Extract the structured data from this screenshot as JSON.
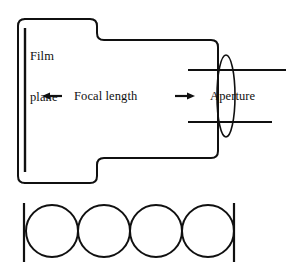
{
  "figure": {
    "background_color": "#ffffff",
    "stroke_color": "#101010",
    "text_color": "#101010",
    "width": 290,
    "height": 271
  },
  "labels": {
    "film_plane": "Film\nplane",
    "film_plane_line1": "Film",
    "film_plane_line2": "plane",
    "focal_length": "Focal length",
    "aperture": "Aperture"
  },
  "icons": {
    "left_arrow": "left-arrow-icon",
    "right_arrow": "right-arrow-icon",
    "lens_ellipse": "lens-ellipse-icon",
    "film-plane-line": "film-plane-line-icon"
  },
  "geometry": {
    "camera_body": {
      "outline_path": "M 25 19 L 97 19 L 97 40 L 218 40 L 218 158 L 97 158 L 97 183 L 25 183",
      "corner_radius": 7,
      "stroke_width": 2
    },
    "film_plane_line": {
      "x": 25,
      "y1": 28,
      "y2": 172,
      "stroke_width": 2.4
    },
    "lens": {
      "cx": 226,
      "cy": 96,
      "rx": 9,
      "ry": 41,
      "stroke_width": 1.6
    },
    "aperture_blade_upper": {
      "x1": 188,
      "x2": 286,
      "y": 70,
      "stroke_width": 2.2
    },
    "aperture_blade_lower": {
      "x1": 188,
      "x2": 272,
      "y": 122,
      "stroke_width": 2.2
    },
    "focal_arrow_left": {
      "x1": 62,
      "x2": 44,
      "y": 96
    },
    "focal_arrow_right": {
      "x1": 174,
      "x2": 194,
      "y": 96
    },
    "circle_row": {
      "count": 4,
      "radius": 26,
      "cy": 231,
      "centers_x": [
        52,
        104,
        156,
        208
      ],
      "left_bar_x": 24,
      "right_bar_x": 234,
      "bar_y1": 203,
      "bar_y2": 262,
      "stroke_width": 2
    }
  }
}
